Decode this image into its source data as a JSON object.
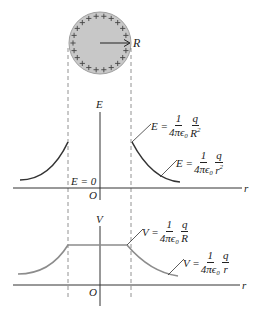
{
  "sphere": {
    "radius_label": "R",
    "charge_sign": "+",
    "fill_color": "#c8c8c8",
    "edge_color": "#9a9a9a"
  },
  "e_graph": {
    "y_axis_label": "E",
    "x_axis_label": "r",
    "origin_label": "O",
    "inside_label": "E = 0",
    "surface_eq": {
      "lhs": "E =",
      "num": "1",
      "den": "4πϵ₀",
      "qnum": "q",
      "qden": "R",
      "power": "2"
    },
    "outside_eq": {
      "lhs": "E =",
      "num": "1",
      "den": "4πϵ₀",
      "qnum": "q",
      "qden": "r",
      "power": "2"
    },
    "curve_color": "#333333"
  },
  "v_graph": {
    "y_axis_label": "V",
    "x_axis_label": "r",
    "origin_label": "O",
    "surface_eq": {
      "lhs": "V =",
      "num": "1",
      "den": "4πϵ₀",
      "qnum": "q",
      "qden": "R"
    },
    "outside_eq": {
      "lhs": "V =",
      "num": "1",
      "den": "4πϵ₀",
      "qnum": "q",
      "qden": "r"
    },
    "curve_color": "#8c8c8c"
  }
}
